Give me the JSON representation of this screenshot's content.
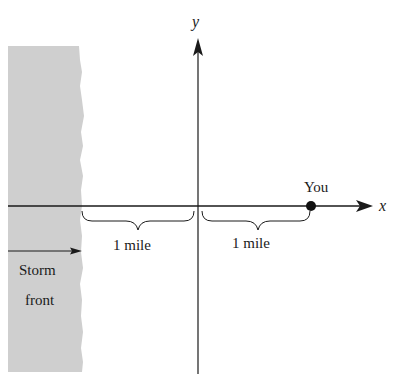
{
  "diagram": {
    "axes": {
      "x_label": "x",
      "y_label": "y"
    },
    "point": {
      "label": "You"
    },
    "distances": [
      {
        "label": "1 mile",
        "from": "storm-front-edge",
        "to": "origin"
      },
      {
        "label": "1 mile",
        "from": "origin",
        "to": "you"
      }
    ],
    "storm": {
      "label_line1": "Storm",
      "label_line2": "front"
    },
    "colors": {
      "storm_fill": "#cfcfcf",
      "lines": "#1a1a1a",
      "background": "#ffffff"
    }
  }
}
